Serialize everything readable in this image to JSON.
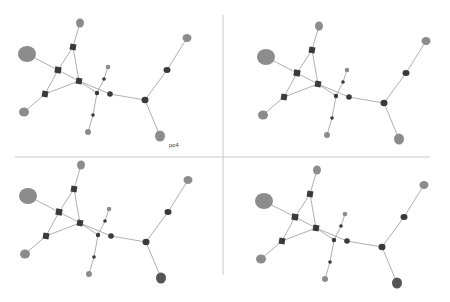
{
  "layout": {
    "width": 450,
    "height": 302,
    "divider_color": "#c8c8c8",
    "h_divider": {
      "y": 157,
      "x1": 15,
      "x2": 430
    },
    "v_divider": {
      "x": 223,
      "y1": 15,
      "y2": 275
    }
  },
  "label": {
    "text": "pc4",
    "x": 169,
    "y": 142
  },
  "colors": {
    "edge": "#9a9a9a",
    "hub": "#3a3a3a",
    "leaf": "#8c8c8c",
    "leaf_dark": "#555555"
  },
  "graph": {
    "nodes": [
      {
        "id": "big-left",
        "x": 27,
        "y": 54,
        "rx": 9,
        "ry": 8,
        "shape": "ellipse",
        "kind": "leaf"
      },
      {
        "id": "top-leaf",
        "x": 80,
        "y": 23,
        "rx": 4,
        "ry": 4.5,
        "shape": "ellipse",
        "kind": "leaf"
      },
      {
        "id": "top-sq",
        "x": 73,
        "y": 47,
        "rx": 3,
        "ry": 3,
        "shape": "square",
        "kind": "hub"
      },
      {
        "id": "left-sq",
        "x": 58,
        "y": 70,
        "rx": 3.2,
        "ry": 3.2,
        "shape": "square",
        "kind": "hub"
      },
      {
        "id": "center-sq",
        "x": 79,
        "y": 81,
        "rx": 3,
        "ry": 3,
        "shape": "square",
        "kind": "hub"
      },
      {
        "id": "lowleft-sq",
        "x": 45,
        "y": 94,
        "rx": 3,
        "ry": 3,
        "shape": "square",
        "kind": "hub"
      },
      {
        "id": "lowleft-leaf",
        "x": 24,
        "y": 112,
        "rx": 5,
        "ry": 4.5,
        "shape": "ellipse",
        "kind": "leaf"
      },
      {
        "id": "small-top",
        "x": 108,
        "y": 67,
        "rx": 2.3,
        "ry": 2.3,
        "shape": "ellipse",
        "kind": "leaf"
      },
      {
        "id": "small-dot",
        "x": 104,
        "y": 79,
        "rx": 1.8,
        "ry": 1.8,
        "shape": "ellipse",
        "kind": "hub"
      },
      {
        "id": "mid-node",
        "x": 97,
        "y": 93,
        "rx": 2.2,
        "ry": 2.2,
        "shape": "ellipse",
        "kind": "hub"
      },
      {
        "id": "mid-circle",
        "x": 110,
        "y": 94,
        "rx": 2.8,
        "ry": 2.8,
        "shape": "ellipse",
        "kind": "hub"
      },
      {
        "id": "low-dot",
        "x": 93,
        "y": 115,
        "rx": 1.8,
        "ry": 1.8,
        "shape": "ellipse",
        "kind": "hub"
      },
      {
        "id": "bottom-leaf",
        "x": 88,
        "y": 132,
        "rx": 3,
        "ry": 3,
        "shape": "ellipse",
        "kind": "leaf"
      },
      {
        "id": "right-hub",
        "x": 145,
        "y": 100,
        "rx": 3.5,
        "ry": 3.2,
        "shape": "ellipse",
        "kind": "hub"
      },
      {
        "id": "right-sq",
        "x": 167,
        "y": 70,
        "rx": 3.5,
        "ry": 3,
        "shape": "ellipse",
        "kind": "hub"
      },
      {
        "id": "topright-leaf",
        "x": 187,
        "y": 38,
        "rx": 4.5,
        "ry": 4,
        "shape": "ellipse",
        "kind": "leaf"
      },
      {
        "id": "botright-leaf",
        "x": 160,
        "y": 136,
        "rx": 5,
        "ry": 5.5,
        "shape": "ellipse",
        "kind": "leaf"
      }
    ],
    "edges": [
      [
        "big-left",
        "left-sq"
      ],
      [
        "top-leaf",
        "top-sq"
      ],
      [
        "top-sq",
        "left-sq"
      ],
      [
        "top-sq",
        "center-sq"
      ],
      [
        "left-sq",
        "center-sq"
      ],
      [
        "left-sq",
        "lowleft-sq"
      ],
      [
        "lowleft-sq",
        "center-sq"
      ],
      [
        "lowleft-sq",
        "lowleft-leaf"
      ],
      [
        "center-sq",
        "mid-circle"
      ],
      [
        "center-sq",
        "mid-node"
      ],
      [
        "small-top",
        "small-dot"
      ],
      [
        "small-dot",
        "mid-node"
      ],
      [
        "mid-node",
        "low-dot"
      ],
      [
        "low-dot",
        "bottom-leaf"
      ],
      [
        "mid-circle",
        "right-hub"
      ],
      [
        "right-hub",
        "right-sq"
      ],
      [
        "right-sq",
        "topright-leaf"
      ],
      [
        "right-hub",
        "botright-leaf"
      ]
    ]
  },
  "panels": [
    {
      "name": "panel-top-left",
      "dx": 0,
      "dy": 0,
      "scale": 1.0,
      "variant": "light"
    },
    {
      "name": "panel-top-right",
      "dx": 225,
      "dy": 0,
      "scale": 1.0,
      "variant": "light",
      "offset": {
        "x": 14,
        "y": 3
      }
    },
    {
      "name": "panel-bottom-left",
      "dx": 0,
      "dy": 151,
      "scale": 1.0,
      "variant": "dark-bottom",
      "offset": {
        "x": 1,
        "y": -9
      }
    },
    {
      "name": "panel-bottom-right",
      "dx": 225,
      "dy": 151,
      "scale": 1.0,
      "variant": "dark-bottom",
      "offset": {
        "x": 12,
        "y": -4
      }
    }
  ]
}
